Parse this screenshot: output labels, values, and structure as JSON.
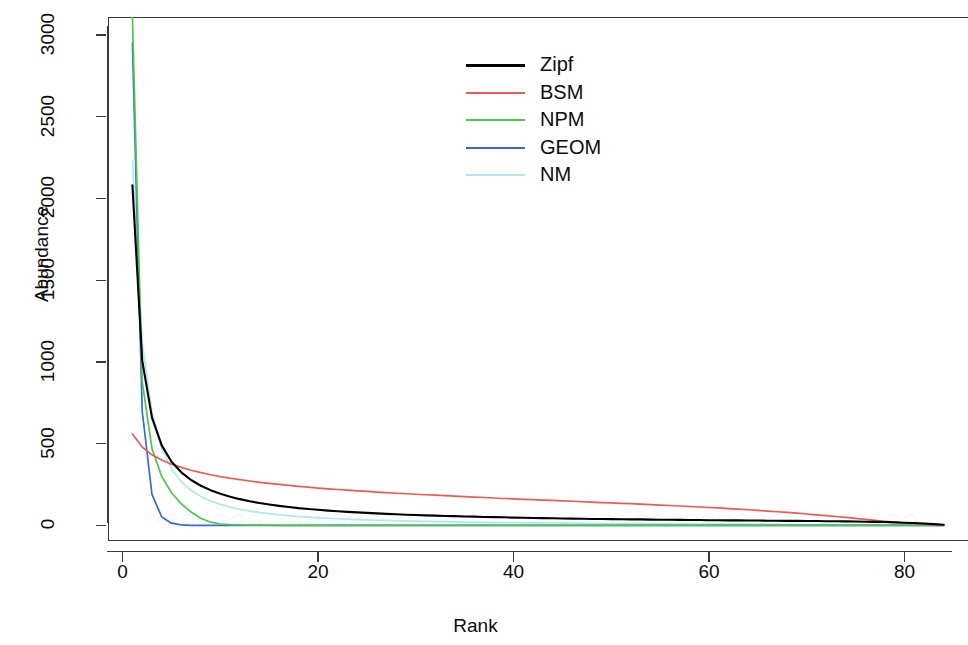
{
  "chart_data": {
    "type": "line",
    "title": "",
    "xlabel": "Rank",
    "ylabel": "Abundance",
    "xlim": [
      -1.5,
      86.5
    ],
    "ylim": [
      -95,
      3110
    ],
    "grid": false,
    "legend_position": "top-center-right",
    "xticks": [
      0,
      20,
      40,
      60,
      80
    ],
    "yticks": [
      0,
      500,
      1000,
      1500,
      2000,
      2500,
      3000
    ],
    "xtick_labels": [
      "0",
      "20",
      "40",
      "60",
      "80"
    ],
    "ytick_labels": [
      "0",
      "500",
      "1000",
      "1500",
      "2000",
      "2500",
      "3000"
    ],
    "x": [
      1,
      2,
      3,
      4,
      5,
      6,
      7,
      8,
      9,
      10,
      11,
      12,
      13,
      14,
      15,
      16,
      17,
      18,
      19,
      20,
      21,
      22,
      23,
      24,
      25,
      26,
      27,
      28,
      29,
      30,
      31,
      32,
      33,
      34,
      35,
      36,
      37,
      38,
      39,
      40,
      41,
      42,
      43,
      44,
      45,
      46,
      47,
      48,
      49,
      50,
      51,
      52,
      53,
      54,
      55,
      56,
      57,
      58,
      59,
      60,
      61,
      62,
      63,
      64,
      65,
      66,
      67,
      68,
      69,
      70,
      71,
      72,
      73,
      74,
      75,
      76,
      77,
      78,
      79,
      80,
      81,
      82,
      83,
      84
    ],
    "series": [
      {
        "name": "Zipf",
        "color": "#000000",
        "values": [
          2080,
          1010,
          660,
          490,
          390,
          325,
          278,
          243,
          216,
          194,
          176,
          161,
          148,
          137,
          128,
          120,
          113,
          106,
          101,
          96,
          91,
          87,
          83,
          80,
          77,
          74,
          71,
          69,
          66,
          64,
          62,
          60,
          58,
          57,
          55,
          54,
          52,
          51,
          50,
          48,
          47,
          46,
          45,
          44,
          43,
          42,
          41,
          40,
          40,
          39,
          38,
          37,
          37,
          36,
          35,
          35,
          34,
          33,
          33,
          32,
          32,
          31,
          31,
          30,
          30,
          29,
          29,
          28,
          28,
          27,
          27,
          26,
          26,
          25,
          24,
          23,
          22,
          21,
          19,
          17,
          15,
          12,
          8,
          4
        ]
      },
      {
        "name": "BSM",
        "color": "#F05A52",
        "values": [
          560,
          480,
          432,
          400,
          375,
          355,
          338,
          323,
          310,
          299,
          289,
          280,
          272,
          264,
          257,
          251,
          245,
          239,
          234,
          229,
          224,
          220,
          216,
          212,
          208,
          204,
          201,
          197,
          194,
          191,
          188,
          185,
          182,
          179,
          176,
          173,
          171,
          168,
          165,
          163,
          160,
          158,
          155,
          153,
          150,
          148,
          145,
          143,
          140,
          138,
          135,
          133,
          130,
          127,
          125,
          122,
          119,
          116,
          113,
          110,
          107,
          103,
          100,
          96,
          92,
          88,
          84,
          80,
          75,
          70,
          65,
          60,
          55,
          49,
          43,
          37,
          31,
          25,
          20,
          15,
          11,
          8,
          5,
          2
        ]
      },
      {
        "name": "NPM",
        "color": "#4CC74C",
        "values": [
          3110,
          880,
          470,
          300,
          200,
          132,
          82,
          44,
          20,
          9,
          5,
          3,
          2,
          1.5,
          1.2,
          1,
          0.9,
          0.8,
          0.7,
          0.6,
          0.55,
          0.5,
          0.45,
          0.4,
          0.38,
          0.35,
          0.33,
          0.3,
          0.28,
          0.26,
          0.24,
          0.22,
          0.2,
          0.19,
          0.18,
          0.17,
          0.16,
          0.15,
          0.14,
          0.13,
          0.12,
          0.11,
          0.1,
          0.1,
          0.09,
          0.09,
          0.08,
          0.08,
          0.07,
          0.07,
          0.06,
          0.06,
          0.05,
          0.05,
          0.05,
          0.04,
          0.04,
          0.04,
          0.03,
          0.03,
          0.03,
          0.03,
          0.02,
          0.02,
          0.02,
          0.02,
          0.02,
          0.01,
          0.01,
          0.01,
          0.01,
          0.01,
          0.01,
          0.01,
          0.01,
          0.005,
          0.005,
          0.005,
          0.004,
          0.003,
          0.002,
          0.002,
          0.001,
          0
        ]
      },
      {
        "name": "GEOM",
        "color": "#3B68D8",
        "values": [
          2950,
          700,
          190,
          52,
          14,
          4,
          1.1,
          0.3,
          0.08,
          0.02,
          0.01,
          0.005,
          0.002,
          0.001,
          0.0005,
          0,
          0,
          0,
          0,
          0,
          0,
          0,
          0,
          0,
          0,
          0,
          0,
          0,
          0,
          0,
          0,
          0,
          0,
          0,
          0,
          0,
          0,
          0,
          0,
          0,
          0,
          0,
          0,
          0,
          0,
          0,
          0,
          0,
          0,
          0,
          0,
          0,
          0,
          0,
          0,
          0,
          0,
          0,
          0,
          0,
          0,
          0,
          0,
          0,
          0,
          0,
          0,
          0,
          0,
          0,
          0,
          0,
          0,
          0,
          0,
          0,
          0,
          0,
          0,
          0,
          0,
          0,
          0,
          0
        ]
      },
      {
        "name": "NM",
        "color": "#AEE8F0",
        "values": [
          2230,
          1120,
          690,
          470,
          345,
          268,
          215,
          178,
          150,
          129,
          112,
          99,
          88,
          79,
          72,
          65,
          60,
          55,
          51,
          47,
          44,
          41,
          39,
          36,
          34,
          32,
          31,
          29,
          28,
          26,
          25,
          24,
          23,
          22,
          21,
          20,
          19,
          18,
          18,
          17,
          16,
          16,
          15,
          15,
          14,
          14,
          13,
          13,
          12,
          12,
          12,
          11,
          11,
          11,
          10,
          10,
          10,
          9,
          9,
          9,
          8,
          8,
          8,
          7,
          7,
          7,
          6,
          6,
          6,
          5,
          5,
          5,
          4,
          4,
          4,
          3,
          3,
          3,
          2,
          2,
          2,
          1,
          1,
          0
        ]
      }
    ]
  },
  "legend": {
    "entries": [
      {
        "label": "Zipf",
        "color": "#000000"
      },
      {
        "label": "BSM",
        "color": "#F05A52"
      },
      {
        "label": "NPM",
        "color": "#4CC74C"
      },
      {
        "label": "GEOM",
        "color": "#3B68D8"
      },
      {
        "label": "NM",
        "color": "#AEE8F0"
      }
    ]
  },
  "axes": {
    "x_title": "Rank",
    "y_title": "Abundance"
  }
}
